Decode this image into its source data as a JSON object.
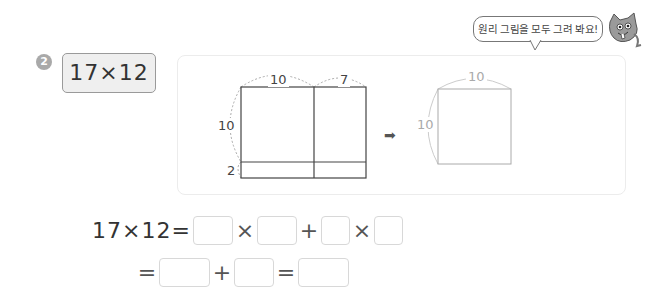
{
  "problem": {
    "number": "2",
    "expression": "17×12"
  },
  "speech_bubble": {
    "text": "원리 그림을 모두 그려 봐요!"
  },
  "diagram_left": {
    "top_labels": [
      "10",
      "7"
    ],
    "side_labels": [
      "10",
      "2"
    ]
  },
  "diagram_right": {
    "top_label": "10",
    "side_label": "10"
  },
  "arrow": "➡",
  "equation": {
    "line1_lhs": "17×12=",
    "times": "×",
    "plus": "+",
    "equals": "=",
    "line2_start": "="
  },
  "answers": {
    "a1": "",
    "a2": "",
    "a3": "",
    "a4": "",
    "b1": "",
    "b2": "",
    "b3": ""
  }
}
